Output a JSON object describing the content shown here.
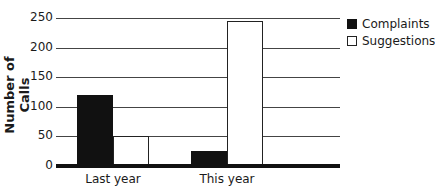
{
  "chart_data": {
    "type": "bar",
    "title": "",
    "xlabel": "",
    "ylabel": "Number of Calls",
    "categories": [
      "Last year",
      "This year"
    ],
    "series": [
      {
        "name": "Complaints",
        "values": [
          120,
          25
        ],
        "color": "#111111"
      },
      {
        "name": "Suggestions",
        "values": [
          50,
          245
        ],
        "color": "#ffffff"
      }
    ],
    "ylim": [
      0,
      250
    ],
    "yticks": [
      0,
      50,
      100,
      150,
      200,
      250
    ],
    "grid": true,
    "legend_position": "right"
  }
}
